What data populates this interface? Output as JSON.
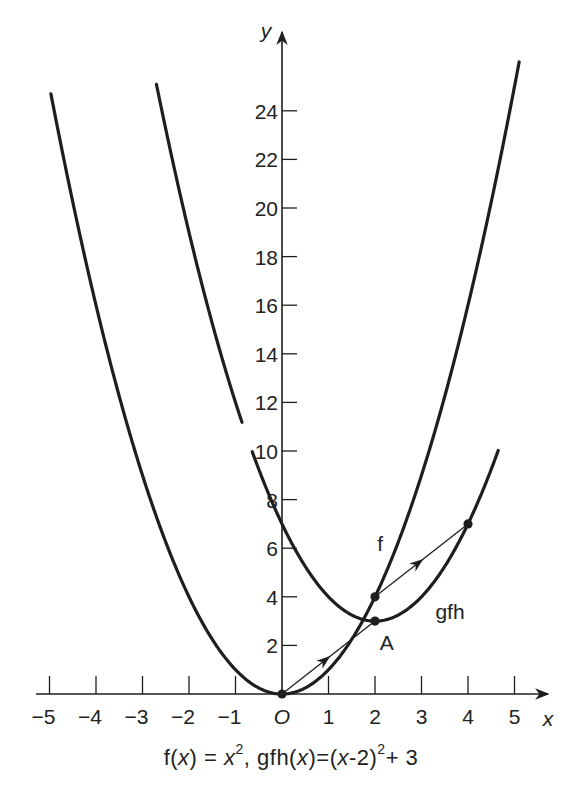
{
  "chart_data": {
    "type": "line",
    "title": "",
    "caption": {
      "f_part": "f(x) = x², ",
      "gfh_part": "gfh(x) = (x-2)² + 3",
      "full": "f(x) = x², gfh(x)=(x-2)²+3"
    },
    "xlabel": "x",
    "ylabel": "y",
    "origin_label": "O",
    "xlim": [
      -5.2,
      5.6
    ],
    "ylim": [
      0,
      26
    ],
    "x_ticks": [
      -5,
      -4,
      -3,
      -2,
      -1,
      0,
      1,
      2,
      3,
      4,
      5
    ],
    "x_tick_labels": [
      "-5",
      "-4",
      "-3",
      "-2",
      "-1",
      "O",
      "1",
      "2",
      "3",
      "4",
      "5"
    ],
    "y_ticks": [
      2,
      4,
      6,
      8,
      10,
      12,
      14,
      16,
      18,
      20,
      22,
      24
    ],
    "y_tick_labels": [
      "2",
      "4",
      "6",
      "8",
      "10",
      "12",
      "14",
      "16",
      "18",
      "20",
      "22",
      "24"
    ],
    "grid": false,
    "series": [
      {
        "name": "f",
        "formula": "x^2",
        "x_range": [
          -4.97,
          5.1
        ],
        "label": "f",
        "x": [
          -5,
          -4,
          -3,
          -2,
          -1,
          0,
          1,
          2,
          3,
          4,
          5
        ],
        "y": [
          25,
          16,
          9,
          4,
          1,
          0,
          1,
          4,
          9,
          16,
          25
        ]
      },
      {
        "name": "gfh",
        "formula": "(x-2)^2+3",
        "x_range": [
          -2.7,
          4.65
        ],
        "label": "gfh",
        "x": [
          -2,
          -1,
          0,
          1,
          2,
          3,
          4
        ],
        "y": [
          19,
          12,
          7,
          4,
          3,
          4,
          7
        ]
      }
    ],
    "points": [
      {
        "name": "origin",
        "x": 0,
        "y": 0,
        "label": ""
      },
      {
        "name": "f-at-2",
        "x": 2,
        "y": 4,
        "label": ""
      },
      {
        "name": "A",
        "x": 2,
        "y": 3,
        "label": "A"
      },
      {
        "name": "gfh-at-4",
        "x": 4,
        "y": 7,
        "label": ""
      }
    ],
    "arrows": [
      {
        "from": [
          0,
          0
        ],
        "to": [
          2,
          3
        ],
        "description": "translation vector from vertex of f to vertex A of gfh"
      },
      {
        "from": [
          2,
          4
        ],
        "to": [
          4,
          7
        ],
        "description": "translation vector from f(2) to gfh(4)"
      }
    ],
    "annotations": [
      {
        "text": "f",
        "x": 2.05,
        "y": 5.9
      },
      {
        "text": "gfh",
        "x": 3.3,
        "y": 3.1
      },
      {
        "text": "A",
        "x": 2.1,
        "y": 1.8
      }
    ]
  },
  "layout": {
    "origin_px": [
      282,
      694
    ],
    "px_per_x_unit": 46.5,
    "px_per_y_unit": 24.3,
    "ink_color": "#1e1e1e"
  }
}
